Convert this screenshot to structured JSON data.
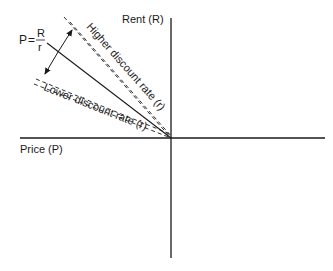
{
  "diagram": {
    "y_axis_label": "Rent (R)",
    "x_axis_label": "Price (P)",
    "formula": {
      "lhs": "P",
      "equals": "=",
      "numerator": "R",
      "denominator": "r"
    },
    "upper_line_label": "Higher discount rate (r)",
    "lower_line_label": "Lower discount rate (r)",
    "colors": {
      "line": "#1a1a1a",
      "background": "#ffffff"
    }
  }
}
